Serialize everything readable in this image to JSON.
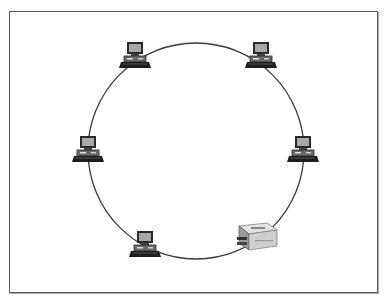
{
  "diagram": {
    "topology": "ring",
    "ring": {
      "cx": 196,
      "cy": 151,
      "r": 108,
      "stroke": "#3a3a3a"
    },
    "nodes": [
      {
        "id": "pc-top-left",
        "type": "computer",
        "x": 136,
        "y": 57
      },
      {
        "id": "pc-top-right",
        "type": "computer",
        "x": 262,
        "y": 57
      },
      {
        "id": "pc-left",
        "type": "computer",
        "x": 89,
        "y": 151
      },
      {
        "id": "pc-right",
        "type": "computer",
        "x": 304,
        "y": 151
      },
      {
        "id": "pc-bottom-left",
        "type": "computer",
        "x": 146,
        "y": 246
      },
      {
        "id": "printer-bottom-right",
        "type": "printer",
        "x": 255,
        "y": 238
      }
    ],
    "colors": {
      "frame": "#5a5a5a",
      "monitor_screen": "#a8a8a8",
      "monitor_border": "#2a2a2a",
      "keyboard": "#1e1e1e",
      "printer_body": "#d6d6d6"
    }
  }
}
